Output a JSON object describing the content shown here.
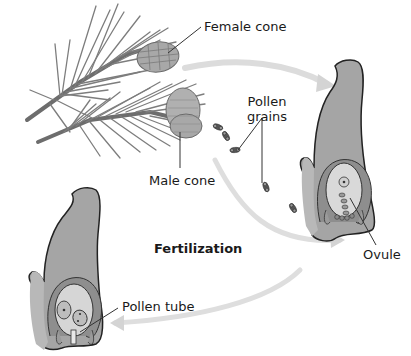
{
  "diagram": {
    "title_implied": "Pine life cycle — pollination and fertilization",
    "labels": {
      "female_cone": "Female cone",
      "male_cone": "Male cone",
      "pollen_grains_line1": "Pollen",
      "pollen_grains_line2": "grains",
      "ovule": "Ovule",
      "fertilization": "Fertilization",
      "pollen_tube": "Pollen tube"
    },
    "colors": {
      "tissue_fill": "#a4a4a4",
      "tissue_outline": "#2a2a2a",
      "ovule_fill": "#d8d8d8",
      "inner_ring": "#8c8c8c",
      "arrow": "#d9d9d9",
      "needle": "#7a7a7a",
      "cone": "#9a9a9a",
      "leader_line": "#333333"
    },
    "nodes": [
      {
        "id": "pine-branch",
        "kind": "illustration",
        "contains": [
          "female-cone",
          "male-cone"
        ]
      },
      {
        "id": "pollen-grains",
        "kind": "illustration"
      },
      {
        "id": "ovule-before",
        "kind": "illustration",
        "label": "Ovule"
      },
      {
        "id": "ovule-fertilized",
        "kind": "illustration",
        "label": "Pollen tube"
      }
    ],
    "edges": [
      {
        "from": "pine-branch",
        "to": "ovule-before",
        "style": "curved-arrow"
      },
      {
        "from": "pine-branch",
        "to": "ovule-before",
        "via": "pollen-grains",
        "style": "curved-arrow"
      },
      {
        "from": "ovule-before",
        "to": "ovule-fertilized",
        "style": "curved-arrow",
        "label": "Fertilization"
      }
    ]
  }
}
